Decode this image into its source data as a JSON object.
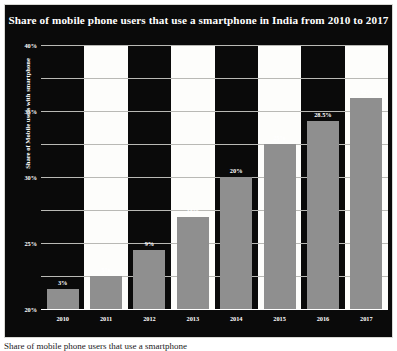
{
  "chart_data": {
    "type": "bar",
    "title": "Share of mobile phone users that use a smartphone in India from 2010 to 2017",
    "xlabel": "",
    "ylabel": "Share of Mobile users with smartphone",
    "categories": [
      "2010",
      "2011",
      "2012",
      "2013",
      "2014",
      "2015",
      "2016",
      "2017"
    ],
    "values": [
      3,
      5,
      9,
      14,
      20,
      25,
      28.5,
      32
    ],
    "data_labels": [
      "3%",
      "5%",
      "9%",
      "14%",
      "20%",
      "25%",
      "28.5%",
      "32%"
    ],
    "ylim": [
      0,
      40
    ],
    "ytick_values": [
      0,
      5,
      10,
      15,
      20,
      25,
      30,
      35,
      40
    ],
    "ytick_labels": [
      "0%",
      "5%",
      "10%",
      "15%",
      "20%",
      "25%",
      "30%",
      "35%",
      "40%"
    ],
    "grid": true,
    "legend": false,
    "colors": {
      "background": "#0a0a0a",
      "band": "#fdfdfb",
      "bar": "#8f8f8f",
      "text": "#ffffff",
      "gridline": "#b9b9b5",
      "border": "#d8d8d4"
    }
  },
  "caption": {
    "text": "Share of mobile phone users that use a smartphone"
  }
}
